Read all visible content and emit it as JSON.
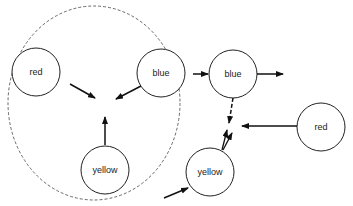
{
  "diagram": {
    "group": {
      "style": "dashed",
      "contains": [
        "red-left",
        "blue-left",
        "yellow-left"
      ]
    },
    "nodes": [
      {
        "id": "red-left",
        "label": "red",
        "cx": 36,
        "cy": 72
      },
      {
        "id": "blue-left",
        "label": "blue",
        "cx": 161,
        "cy": 73
      },
      {
        "id": "yellow-left",
        "label": "yellow",
        "cx": 105,
        "cy": 170
      },
      {
        "id": "blue-right",
        "label": "blue",
        "cx": 233,
        "cy": 74
      },
      {
        "id": "red-right",
        "label": "red",
        "cx": 321,
        "cy": 127
      },
      {
        "id": "yellow-right",
        "label": "yellow",
        "cx": 210,
        "cy": 172
      }
    ],
    "edges": [
      {
        "from": "red-left",
        "to": "center",
        "style": "solid"
      },
      {
        "from": "blue-left",
        "to": "center",
        "style": "solid"
      },
      {
        "from": "yellow-left",
        "to": "center",
        "style": "solid"
      },
      {
        "from": "group",
        "to": "blue-right",
        "style": "solid"
      },
      {
        "from": "blue-right",
        "to": "out",
        "style": "solid"
      },
      {
        "from": "blue-right",
        "to": "yellow-right",
        "style": "dashed"
      },
      {
        "from": "yellow-right",
        "to": "blue-right",
        "style": "solid-double"
      },
      {
        "from": "red-right",
        "to": "between",
        "style": "solid"
      },
      {
        "from": "in",
        "to": "yellow-right",
        "style": "solid"
      }
    ]
  }
}
